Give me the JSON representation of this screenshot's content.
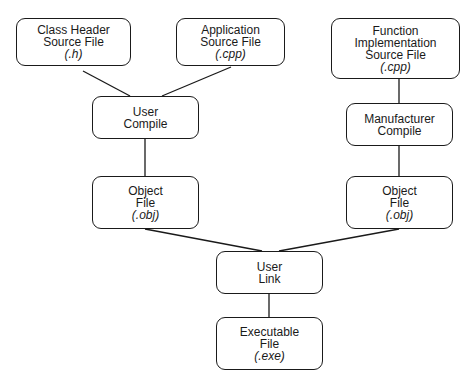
{
  "nodes": {
    "class_header": {
      "lines": [
        "Class Header",
        "Source File"
      ],
      "ext": "(.h)"
    },
    "application": {
      "lines": [
        "Application",
        "Source File"
      ],
      "ext": "(.cpp)"
    },
    "function_impl": {
      "lines": [
        "Function",
        "Implementation",
        "Source File"
      ],
      "ext": "(.cpp)"
    },
    "user_compile": {
      "lines": [
        "User",
        "Compile"
      ]
    },
    "manufacturer_compile": {
      "lines": [
        "Manufacturer",
        "Compile"
      ]
    },
    "object_left": {
      "lines": [
        "Object",
        "File"
      ],
      "ext": "(.obj)"
    },
    "object_right": {
      "lines": [
        "Object",
        "File"
      ],
      "ext": "(.obj)"
    },
    "user_link": {
      "lines": [
        "User",
        "Link"
      ]
    },
    "executable": {
      "lines": [
        "Executable",
        "File"
      ],
      "ext": "(.exe)"
    }
  },
  "colors": {
    "stroke": "#1a1a1a",
    "background": "#ffffff"
  }
}
